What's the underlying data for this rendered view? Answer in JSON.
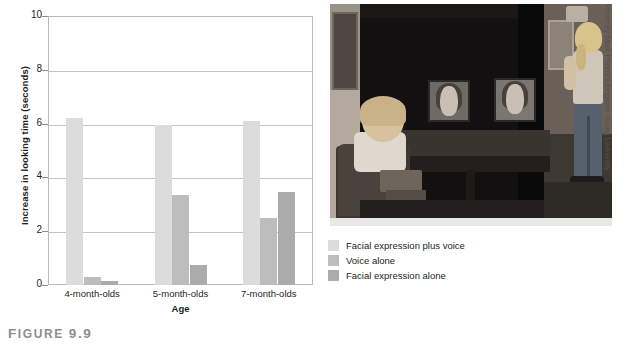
{
  "chart_data": {
    "type": "bar",
    "title": "",
    "xlabel": "Age",
    "ylabel": "Increase in looking time (seconds)",
    "ylim": [
      0,
      10
    ],
    "yticks": [
      "0",
      "2",
      "4",
      "6",
      "8",
      "10"
    ],
    "grid": true,
    "legend_position": "right-below",
    "categories": [
      "4-month-olds",
      "5-month-olds",
      "7-month-olds"
    ],
    "series": [
      {
        "name": "Facial expression plus voice",
        "color": "#dcdcdc",
        "values": [
          6.2,
          5.95,
          6.1
        ]
      },
      {
        "name": "Voice alone",
        "color": "#bdbdbd",
        "values": [
          0.3,
          3.35,
          2.5
        ]
      },
      {
        "name": "Facial expression alone",
        "color": "#ababab",
        "values": [
          0.15,
          0.75,
          3.45
        ]
      }
    ]
  },
  "legend": {
    "items": [
      {
        "label": "Facial expression plus voice"
      },
      {
        "label": "Voice alone"
      },
      {
        "label": "Facial expression alone"
      }
    ]
  },
  "photo": {
    "credit": "Photo by Mark Philbrick/Brigham Young University",
    "description": "Infant seated in a high chair viewing two video screens showing a woman's face, while a researcher stands at the right side of the darkened room."
  },
  "caption": {
    "prefix": "F",
    "word": "IGURE",
    "number": "9.9"
  }
}
